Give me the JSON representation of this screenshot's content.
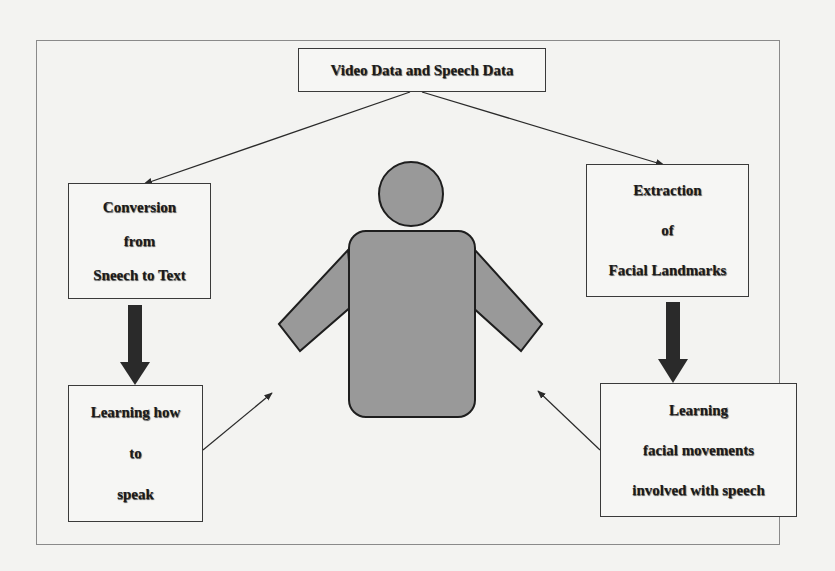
{
  "figure": {
    "source_node": {
      "label": "Video Data and Speech Data"
    },
    "nodes": [
      {
        "id": "conversion",
        "lines": [
          "Conversion",
          "from",
          "Sneech to Text"
        ]
      },
      {
        "id": "extraction",
        "lines": [
          "Extraction",
          "of",
          "Facial Landmarks"
        ]
      },
      {
        "id": "learn_speak",
        "lines": [
          "Learning how",
          "to",
          "speak"
        ]
      },
      {
        "id": "learn_facial",
        "lines": [
          "Learning",
          "facial movements",
          "involved with speech"
        ]
      }
    ],
    "center_icon": "person-icon",
    "edges": [
      {
        "from": "Video Data and Speech Data",
        "to": "Conversion from Speech to Text",
        "style": "thin-arrow"
      },
      {
        "from": "Video Data and Speech Data",
        "to": "Extraction of Facial Landmarks",
        "style": "thin-arrow"
      },
      {
        "from": "Conversion from Speech to Text",
        "to": "Learning how to speak",
        "style": "thick-arrow"
      },
      {
        "from": "Extraction of Facial Landmarks",
        "to": "Learning facial movements involved with speech",
        "style": "thick-arrow"
      },
      {
        "from": "Learning how to speak",
        "to": "person",
        "style": "thin-arrow"
      },
      {
        "from": "Learning facial movements involved with speech",
        "to": "person",
        "style": "thin-arrow"
      }
    ],
    "colors": {
      "figure_fill": "#999999",
      "figure_stroke": "#1e1e1e",
      "thick_arrow": "#2a2a2a",
      "frame": "#8a8a8a"
    }
  }
}
